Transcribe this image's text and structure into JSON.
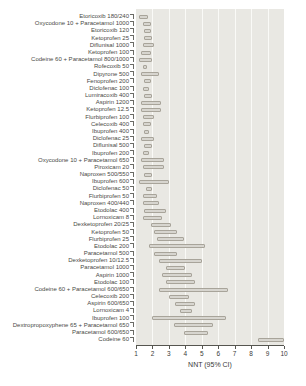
{
  "chart_data": {
    "type": "bar",
    "subtype": "horizontal-ci-range",
    "title": "",
    "xlabel": "NNT (95% CI)",
    "xlim": [
      1,
      10
    ],
    "x_ticks": [
      1,
      2,
      3,
      4,
      5,
      6,
      7,
      8,
      9,
      10
    ],
    "grid": true,
    "legend": "none",
    "categories": [
      "Etoricoxib 180/240",
      "Oxycodone 10 + Paracetamol 1000",
      "Etoricoxib 120",
      "Ketoprofen 25",
      "Diflunisal 1000",
      "Ketoprofen 100",
      "Codeine 60 + Paracetamol 800/1000",
      "Rofecoxib 50",
      "Dipyrone 500",
      "Fenoprofen 200",
      "Diclofenac 100",
      "Lumiracoxib 400",
      "Aspirin 1200",
      "Ketoprofen 12.5",
      "Flurbiprofen 100",
      "Celecoxib 400",
      "Ibuprofen 400",
      "Diclofenac 25",
      "Diflunisal 500",
      "Ibuprofen 200",
      "Oxycodone 10 + Paracetamol 650",
      "Piroxicam 20",
      "Naproxen 500/550",
      "Ibuprofen 600",
      "Diclofenac 50",
      "Flurbiprofen 50",
      "Naproxen 400/440",
      "Etodolac 400",
      "Lornoxicam 8",
      "Dexketoprofen 20/25",
      "Ketoprofen 50",
      "Flurbiprofen 25",
      "Etodolac 200",
      "Paracetamol 500",
      "Dexketoprofen 10/12.5",
      "Paracetamol 1000",
      "Aspirin 1000",
      "Etodolac 100",
      "Codeine 60 + Paracetamol 600/650",
      "Celecoxib 200",
      "Aspirin 600/650",
      "Lornoxicam 4",
      "Ibuprofen 100",
      "Dextropropoxyphene 65 + Paracetamol 650",
      "Paracetamol 600/650",
      "Codeine 60"
    ],
    "series": [
      {
        "name": "NNT 95% confidence interval",
        "ranges": [
          [
            1.2,
            1.7
          ],
          [
            1.4,
            1.9
          ],
          [
            1.5,
            1.9
          ],
          [
            1.5,
            2.0
          ],
          [
            1.4,
            2.1
          ],
          [
            1.3,
            1.9
          ],
          [
            1.2,
            2.0
          ],
          [
            1.4,
            1.7
          ],
          [
            1.3,
            2.4
          ],
          [
            1.5,
            1.9
          ],
          [
            1.4,
            1.8
          ],
          [
            1.5,
            2.0
          ],
          [
            1.3,
            2.5
          ],
          [
            1.3,
            2.5
          ],
          [
            1.4,
            2.1
          ],
          [
            1.4,
            1.9
          ],
          [
            1.5,
            1.8
          ],
          [
            1.3,
            2.1
          ],
          [
            1.5,
            2.0
          ],
          [
            1.4,
            1.8
          ],
          [
            1.3,
            2.7
          ],
          [
            1.4,
            2.7
          ],
          [
            1.5,
            2.0
          ],
          [
            1.2,
            3.0
          ],
          [
            1.6,
            2.0
          ],
          [
            1.4,
            2.3
          ],
          [
            1.4,
            2.4
          ],
          [
            1.5,
            2.8
          ],
          [
            1.4,
            2.6
          ],
          [
            1.9,
            3.1
          ],
          [
            2.1,
            3.5
          ],
          [
            2.3,
            3.9
          ],
          [
            1.8,
            5.2
          ],
          [
            2.1,
            3.5
          ],
          [
            2.4,
            5.0
          ],
          [
            2.8,
            4.0
          ],
          [
            2.6,
            4.4
          ],
          [
            2.8,
            4.6
          ],
          [
            2.4,
            6.6
          ],
          [
            3.0,
            4.2
          ],
          [
            3.4,
            4.6
          ],
          [
            3.7,
            4.4
          ],
          [
            2.0,
            6.5
          ],
          [
            3.3,
            5.7
          ],
          [
            3.9,
            5.4
          ],
          [
            8.4,
            10.0
          ]
        ]
      }
    ]
  },
  "colors": {
    "plot_background": "#e9e8e3",
    "gridline": "#fafaf7",
    "bar_fill": "#d7d5cf",
    "bar_border": "#a8a49a",
    "axis": "#55554f",
    "text": "#3a3a38"
  }
}
